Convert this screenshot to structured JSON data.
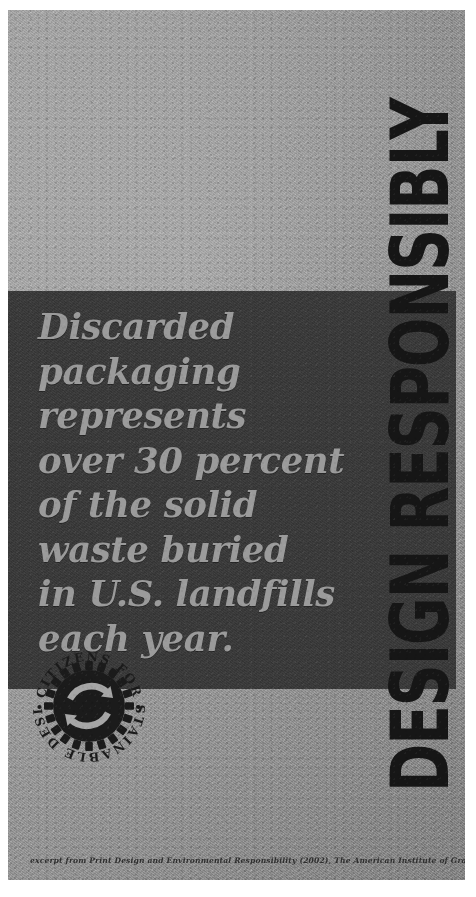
{
  "poster": {
    "headline": "Discarded\npackaging\nrepresents\nover 30 percent\nof the solid\nwaste buried\nin U.S. landfills\neach year.",
    "vertical_title": "DESIGN RESPONSIBLY",
    "credit": "excerpt from Print Design and Environmental Responsibility (2002), The American Institute of Graphic Arts",
    "statistic": {
      "value": "over 30 percent",
      "subject": "Discarded packaging",
      "measure": "of the solid waste buried in U.S. landfills each year"
    },
    "seal": {
      "text_top": "CITIZENS FOR",
      "text_bottom": "SUSTAINABLE DESIGN",
      "bullet": "•",
      "emblem": "recycling-gear-emblem"
    },
    "colors": {
      "paper": "#a6a6a6",
      "quote_band": "#3b3b3b",
      "headline_text": "#9b9b9b",
      "vertical_title_text": "#161616",
      "credit_text": "#2e2e2e",
      "seal_ink": "#1b1b1b",
      "surround": "#ffffff"
    }
  }
}
